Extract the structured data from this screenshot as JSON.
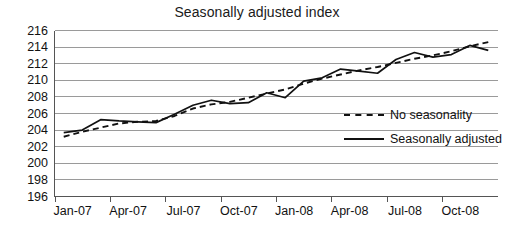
{
  "chart_data": {
    "type": "line",
    "title": "Seasonally adjusted index",
    "xlabel": "",
    "ylabel": "",
    "ylim": [
      196,
      216
    ],
    "ytick_step": 2,
    "yticks": [
      216,
      214,
      212,
      210,
      208,
      206,
      204,
      202,
      200,
      198,
      196
    ],
    "grid": true,
    "legend_position": "inside-right",
    "x": [
      "Jan-07",
      "Feb-07",
      "Mar-07",
      "Apr-07",
      "May-07",
      "Jun-07",
      "Jul-07",
      "Aug-07",
      "Sep-07",
      "Oct-07",
      "Nov-07",
      "Dec-07",
      "Jan-08",
      "Feb-08",
      "Mar-08",
      "Apr-08",
      "May-08",
      "Jun-08",
      "Jul-08",
      "Aug-08",
      "Sep-08",
      "Oct-08",
      "Nov-08",
      "Dec-08"
    ],
    "xtick_labels": [
      "Jan-07",
      "Apr-07",
      "Jul-07",
      "Oct-07",
      "Jan-08",
      "Apr-08",
      "Jul-08",
      "Oct-08"
    ],
    "xtick_indices": [
      0,
      3,
      6,
      9,
      12,
      15,
      18,
      21
    ],
    "series": [
      {
        "name": "No seasonality",
        "style": "dashed",
        "color": "#111111",
        "values": [
          203.2,
          203.8,
          204.3,
          204.8,
          205.0,
          205.1,
          205.7,
          206.6,
          207.1,
          207.4,
          207.9,
          208.4,
          208.9,
          209.6,
          210.2,
          210.7,
          211.2,
          211.6,
          212.1,
          212.6,
          213.0,
          213.5,
          214.1,
          214.6
        ]
      },
      {
        "name": "Seasonally adjusted",
        "style": "solid",
        "color": "#111111",
        "values": [
          203.7,
          204.0,
          205.25,
          205.1,
          205.0,
          204.9,
          205.9,
          207.0,
          207.6,
          207.2,
          207.3,
          208.5,
          207.9,
          209.9,
          210.3,
          211.35,
          211.1,
          210.85,
          212.5,
          213.35,
          212.8,
          213.1,
          214.2,
          213.6
        ]
      }
    ]
  },
  "legend": {
    "items": [
      {
        "label": "No seasonality"
      },
      {
        "label": "Seasonally adjusted"
      }
    ]
  }
}
